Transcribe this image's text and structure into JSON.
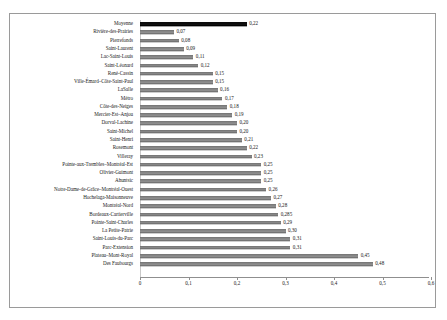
{
  "chart_data": {
    "type": "bar",
    "orientation": "horizontal",
    "title": "",
    "subtitle": "",
    "xlabel": "",
    "ylabel": "",
    "xlim": [
      0,
      0.6
    ],
    "xticks": [
      0,
      0.1,
      0.2,
      0.3,
      0.4,
      0.5,
      0.6
    ],
    "xtick_labels": [
      "0",
      "0,1",
      "0,2",
      "0,3",
      "0,4",
      "0,5",
      "0,6"
    ],
    "grid": false,
    "legend": "none",
    "highlight_color": "#111111",
    "bar_color": "#8d8d8d",
    "categories": [
      "Moyenne",
      "Rivière-des-Prairies",
      "Pierrefonds",
      "Saint-Laurent",
      "Lac-Saint-Louis",
      "Saint-Léonard",
      "René-Cassin",
      "Ville-Émard–Côte-Saint-Paul",
      "LaSalle",
      "Métro",
      "Côte-des-Neiges",
      "Mercier-Est–Anjou",
      "Dorval-Lachine",
      "Saint-Michel",
      "Saint-Henri",
      "Rosemont",
      "Villeray",
      "Pointe-aux-Trembles–Montréal-Est",
      "Olivier-Guimont",
      "Ahuntsic",
      "Notre-Dame-de-Grâce–Montréal-Ouest",
      "Hochelaga-Maisonneuve",
      "Montréal-Nord",
      "Bordeaux-Cartierville",
      "Pointe-Saint-Charles",
      "La Petite-Patrie",
      "Saint-Louis-du-Parc",
      "Parc-Extension",
      "Plateau–Mont-Royal",
      "Des Faubourgs"
    ],
    "values": [
      0.22,
      0.07,
      0.08,
      0.09,
      0.11,
      0.12,
      0.15,
      0.15,
      0.16,
      0.17,
      0.18,
      0.19,
      0.2,
      0.2,
      0.21,
      0.22,
      0.23,
      0.25,
      0.25,
      0.25,
      0.26,
      0.27,
      0.28,
      0.285,
      0.29,
      0.3,
      0.31,
      0.31,
      0.45,
      0.48
    ],
    "value_labels": [
      "0,22",
      "0,07",
      "0,08",
      "0,09",
      "0,11",
      "0,12",
      "0,15",
      "0,15",
      "0,16",
      "0,17",
      "0,18",
      "0,19",
      "0,20",
      "0,20",
      "0,21",
      "0,22",
      "0,23",
      "0,25",
      "0,25",
      "0,25",
      "0,26",
      "0,27",
      "0,28",
      "0,285",
      "0,29",
      "0,30",
      "0,31",
      "0,31",
      "0,45",
      "0,48"
    ],
    "highlight_index": 0
  }
}
